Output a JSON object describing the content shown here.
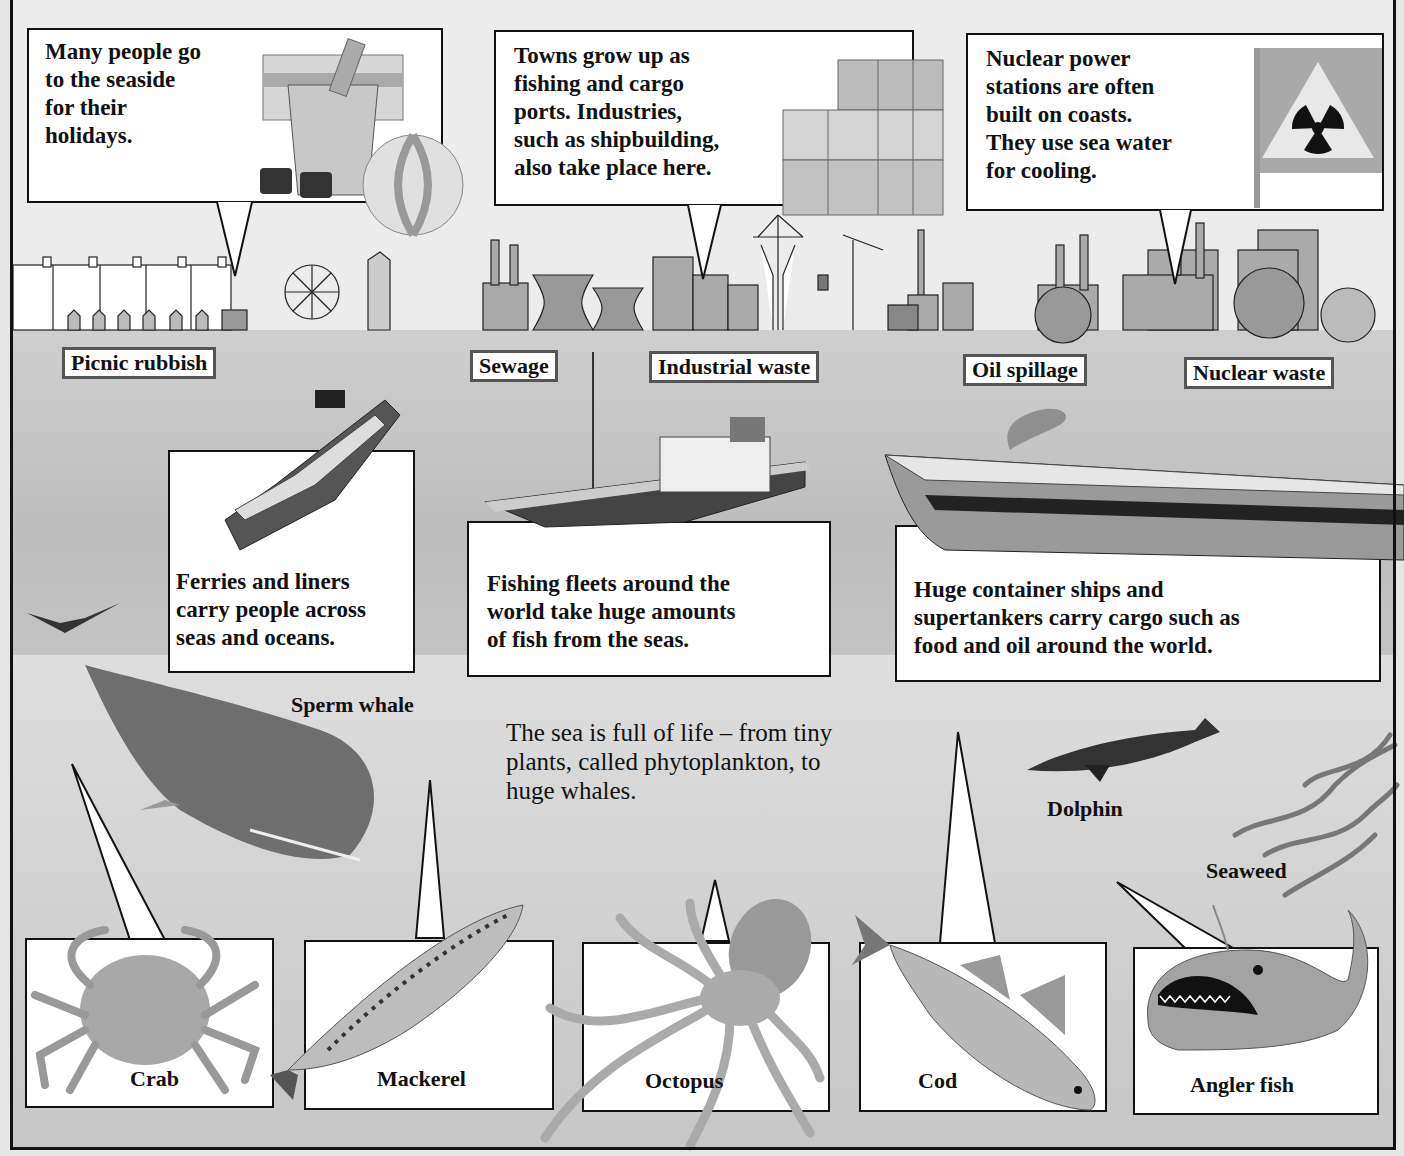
{
  "top_callouts": [
    {
      "id": "seaside",
      "text": "Many people go to the seaside for their holidays.",
      "lines": [
        "Many people go",
        "to the seaside",
        "for their",
        "holidays."
      ],
      "illustration": "beach-bucket-ball-sunglasses"
    },
    {
      "id": "ports",
      "text": "Towns grow up as fishing and cargo ports. Industries, such as shipbuilding, also take place here.",
      "lines": [
        "Towns grow up as",
        "fishing and cargo",
        "ports. Industries,",
        "such as shipbuilding,",
        "also take place here."
      ],
      "illustration": "shipping-containers"
    },
    {
      "id": "nuclear",
      "text": "Nuclear power stations are often built on coasts. They use sea water for cooling.",
      "lines": [
        "Nuclear power",
        "stations are often",
        "built on coasts.",
        "They use sea water",
        "for cooling."
      ],
      "illustration": "radiation-warning-flag"
    }
  ],
  "pollution_labels": [
    "Picnic rubbish",
    "Sewage",
    "Industrial waste",
    "Oil spillage",
    "Nuclear waste"
  ],
  "ship_callouts": [
    {
      "id": "ferries",
      "lines": [
        "Ferries and liners",
        "carry people across",
        "seas and oceans."
      ],
      "illustration": "ferry-liner"
    },
    {
      "id": "fishing",
      "lines": [
        "Fishing fleets around the",
        "world take huge amounts",
        "of fish from the seas."
      ],
      "illustration": "fishing-trawler"
    },
    {
      "id": "cargo",
      "lines": [
        "Huge container ships and",
        "supertankers carry cargo such as",
        "food and oil around the world."
      ],
      "illustration": "supertanker"
    }
  ],
  "intro": {
    "lines": [
      "The sea is full of life – from tiny",
      "plants, called phytoplankton, to",
      "huge whales."
    ]
  },
  "free_labels": {
    "sperm_whale": "Sperm whale",
    "dolphin": "Dolphin",
    "seaweed": "Seaweed"
  },
  "animal_boxes": [
    {
      "label": "Crab"
    },
    {
      "label": "Mackerel"
    },
    {
      "label": "Octopus"
    },
    {
      "label": "Cod"
    },
    {
      "label": "Angler fish"
    }
  ],
  "colors": {
    "sky": "#ececec",
    "sea": "#c4c4c4",
    "deep_sea": "#d6d6d6",
    "border": "#111111",
    "label_border": "#555555"
  }
}
